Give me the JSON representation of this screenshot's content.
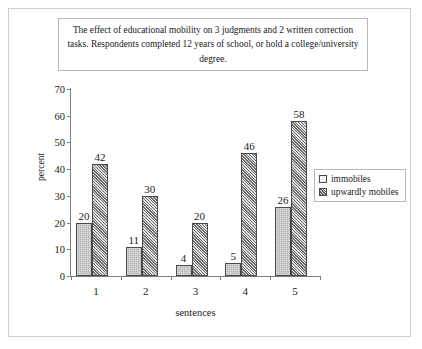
{
  "chart_data": {
    "type": "bar",
    "title": "The effect of educational mobility on 3 judgments and 2 written correction tasks. Respondents completed 12 years of school, or hold a college/university degree.",
    "xlabel": "sentences",
    "ylabel": "percent",
    "categories": [
      "1",
      "2",
      "3",
      "4",
      "5"
    ],
    "series": [
      {
        "name": "immobiles",
        "values": [
          20,
          11,
          4,
          5,
          26
        ]
      },
      {
        "name": "upwardly mobiles",
        "values": [
          42,
          30,
          20,
          46,
          58
        ]
      }
    ],
    "ylim": [
      0,
      70
    ],
    "yticks": [
      0,
      10,
      20,
      30,
      40,
      50,
      60,
      70
    ],
    "ytick_labels": [
      "0",
      "10",
      "20",
      "30",
      "40",
      "50",
      "60",
      "70"
    ],
    "grid": false,
    "legend_position": "right",
    "data_labels": true
  },
  "legend": {
    "items": [
      {
        "label": "immobiles",
        "swatch": "light-square-icon"
      },
      {
        "label": "upwardly mobiles",
        "swatch": "hatched-square-icon"
      }
    ]
  }
}
